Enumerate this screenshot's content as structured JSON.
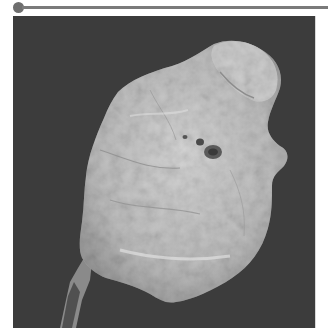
{
  "figure": {
    "background_color": "#3c3c3c",
    "specimen_color": "#c4c4c4",
    "rule_color": "#7a7a7a"
  }
}
